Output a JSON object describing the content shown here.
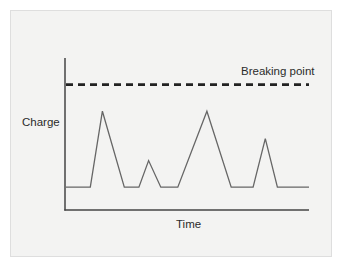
{
  "chart_data": {
    "type": "line",
    "title": "",
    "xlabel": "Time",
    "ylabel": "Charge",
    "grid": false,
    "legend": null,
    "axis_ticks": false,
    "x": [
      0,
      10,
      15,
      24,
      30,
      34,
      39,
      46,
      58,
      68,
      77,
      82,
      87,
      100
    ],
    "series": [
      {
        "name": "Charge",
        "color": "#666666",
        "values": [
          0,
          0,
          100,
          0,
          0,
          35,
          0,
          0,
          100,
          0,
          0,
          64,
          0,
          0
        ]
      }
    ],
    "threshold": {
      "label": "Breaking point",
      "value": 135,
      "style": "dashed",
      "color": "#222222"
    },
    "ylim": [
      -30,
      170
    ],
    "xlim": [
      0,
      100
    ]
  },
  "labels": {
    "y_axis": "Charge",
    "x_axis": "Time",
    "threshold": "Breaking point"
  },
  "colors": {
    "panel_background": "#f3f3f2",
    "panel_border": "#dedede",
    "axis": "#444444",
    "line": "#666666",
    "threshold": "#222222",
    "text": "#2b2b2b"
  }
}
